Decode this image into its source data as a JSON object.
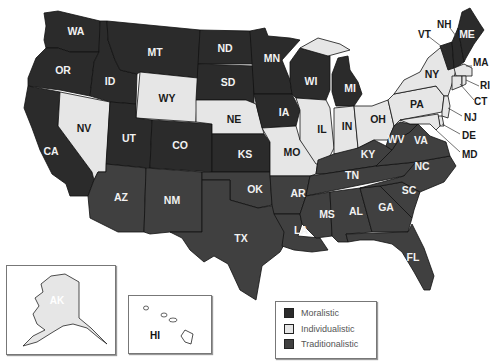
{
  "colors": {
    "moralistic": "#2b2b2b",
    "individualistic": "#e6e6e6",
    "traditionalistic": "#404040"
  },
  "legend": {
    "items": [
      {
        "label": "Moralistic",
        "color": "#2b2b2b"
      },
      {
        "label": "Individualistic",
        "color": "#e6e6e6"
      },
      {
        "label": "Traditionalistic",
        "color": "#404040"
      }
    ]
  },
  "states": {
    "WA": {
      "label": "WA",
      "culture": "Moralistic"
    },
    "OR": {
      "label": "OR",
      "culture": "Moralistic"
    },
    "CA": {
      "label": "CA",
      "culture": "Moralistic"
    },
    "ID": {
      "label": "ID",
      "culture": "Moralistic"
    },
    "NV": {
      "label": "NV",
      "culture": "Individualistic"
    },
    "MT": {
      "label": "MT",
      "culture": "Moralistic"
    },
    "WY": {
      "label": "WY",
      "culture": "Individualistic"
    },
    "UT": {
      "label": "UT",
      "culture": "Moralistic"
    },
    "CO": {
      "label": "CO",
      "culture": "Moralistic"
    },
    "AZ": {
      "label": "AZ",
      "culture": "Traditionalistic"
    },
    "NM": {
      "label": "NM",
      "culture": "Traditionalistic"
    },
    "ND": {
      "label": "ND",
      "culture": "Moralistic"
    },
    "SD": {
      "label": "SD",
      "culture": "Moralistic"
    },
    "NE": {
      "label": "NE",
      "culture": "Individualistic"
    },
    "KS": {
      "label": "KS",
      "culture": "Moralistic"
    },
    "OK": {
      "label": "OK",
      "culture": "Traditionalistic"
    },
    "TX": {
      "label": "TX",
      "culture": "Traditionalistic"
    },
    "MN": {
      "label": "MN",
      "culture": "Moralistic"
    },
    "IA": {
      "label": "IA",
      "culture": "Moralistic"
    },
    "MO": {
      "label": "MO",
      "culture": "Individualistic"
    },
    "AR": {
      "label": "AR",
      "culture": "Traditionalistic"
    },
    "LA": {
      "label": "LA",
      "culture": "Traditionalistic"
    },
    "WI": {
      "label": "WI",
      "culture": "Moralistic"
    },
    "IL": {
      "label": "IL",
      "culture": "Individualistic"
    },
    "MI": {
      "label": "MI",
      "culture": "Moralistic"
    },
    "IN": {
      "label": "IN",
      "culture": "Individualistic"
    },
    "OH": {
      "label": "OH",
      "culture": "Individualistic"
    },
    "KY": {
      "label": "KY",
      "culture": "Traditionalistic"
    },
    "TN": {
      "label": "TN",
      "culture": "Traditionalistic"
    },
    "MS": {
      "label": "MS",
      "culture": "Traditionalistic"
    },
    "AL": {
      "label": "AL",
      "culture": "Traditionalistic"
    },
    "GA": {
      "label": "GA",
      "culture": "Traditionalistic"
    },
    "FL": {
      "label": "FL",
      "culture": "Traditionalistic"
    },
    "SC": {
      "label": "SC",
      "culture": "Traditionalistic"
    },
    "NC": {
      "label": "NC",
      "culture": "Traditionalistic"
    },
    "VA": {
      "label": "VA",
      "culture": "Traditionalistic"
    },
    "WV": {
      "label": "WV",
      "culture": "Traditionalistic"
    },
    "PA": {
      "label": "PA",
      "culture": "Individualistic"
    },
    "NY": {
      "label": "NY",
      "culture": "Individualistic"
    },
    "VT": {
      "label": "VT",
      "culture": "Moralistic"
    },
    "NH": {
      "label": "NH",
      "culture": "Moralistic"
    },
    "ME": {
      "label": "ME",
      "culture": "Moralistic"
    },
    "MA": {
      "label": "MA",
      "culture": "Individualistic"
    },
    "RI": {
      "label": "RI",
      "culture": "Individualistic"
    },
    "CT": {
      "label": "CT",
      "culture": "Individualistic"
    },
    "NJ": {
      "label": "NJ",
      "culture": "Individualistic"
    },
    "DE": {
      "label": "DE",
      "culture": "Individualistic"
    },
    "MD": {
      "label": "MD",
      "culture": "Individualistic"
    },
    "AK": {
      "label": "AK",
      "culture": "Individualistic"
    },
    "HI": {
      "label": "HI",
      "culture": "Individualistic"
    }
  }
}
